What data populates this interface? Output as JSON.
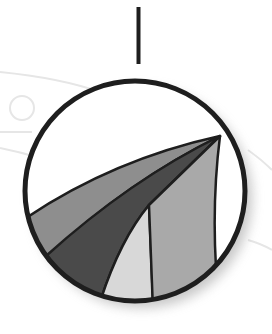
{
  "figure": {
    "colors": {
      "background": "#ffffff",
      "outline": "#1e1e1e",
      "wedge_medium": "#8e8e8e",
      "wedge_dark": "#4a4a4a",
      "wedge_light": "#d8d8d8",
      "wedge_mid_light": "#a9a9a9",
      "watermark": "#e6e6e6",
      "shadow": "#9a9a9a"
    },
    "circle": {
      "cx": 135,
      "cy": 191,
      "r": 110
    },
    "connector": {
      "x": 138.5,
      "y1": 7,
      "y2": 64
    },
    "apex": {
      "x": 220,
      "y": 136
    }
  }
}
